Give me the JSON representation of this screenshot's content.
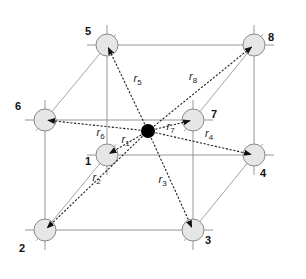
{
  "center_atom": {
    "label": "center",
    "color": "#000000"
  },
  "atom_color": "#e6e6e6",
  "atoms": [
    {
      "id": "1",
      "vector": "r",
      "sub": "1"
    },
    {
      "id": "2",
      "vector": "r",
      "sub": "2"
    },
    {
      "id": "3",
      "vector": "r",
      "sub": "3"
    },
    {
      "id": "4",
      "vector": "r",
      "sub": "4"
    },
    {
      "id": "5",
      "vector": "r",
      "sub": "5"
    },
    {
      "id": "6",
      "vector": "r",
      "sub": "6"
    },
    {
      "id": "7",
      "vector": "r",
      "sub": "7"
    },
    {
      "id": "8",
      "vector": "r",
      "sub": "8"
    }
  ]
}
